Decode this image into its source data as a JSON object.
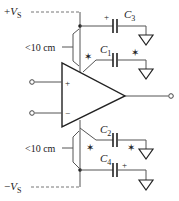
{
  "diagram": {
    "supply_positive": {
      "sign": "+",
      "symbol": "V",
      "subscript": "S"
    },
    "supply_negative": {
      "sign": "−",
      "symbol": "V",
      "subscript": "S"
    },
    "distance_label_top": "<10 cm",
    "distance_label_bottom": "<10 cm",
    "opamp": {
      "plus_label": "+",
      "minus_label": "−"
    },
    "capacitors": [
      {
        "id": "C3",
        "symbol": "C",
        "subscript": "3",
        "polarity": "+",
        "marker": ""
      },
      {
        "id": "C1",
        "symbol": "C",
        "subscript": "1",
        "polarity": "",
        "marker": "✶"
      },
      {
        "id": "C2",
        "symbol": "C",
        "subscript": "2",
        "polarity": "",
        "marker": "✶"
      },
      {
        "id": "C4",
        "symbol": "C",
        "subscript": "4",
        "polarity": "+",
        "marker": ""
      }
    ],
    "star_marker": "✶",
    "colors": {
      "line": "#555555",
      "text": "#222222",
      "background": "#ffffff"
    }
  }
}
